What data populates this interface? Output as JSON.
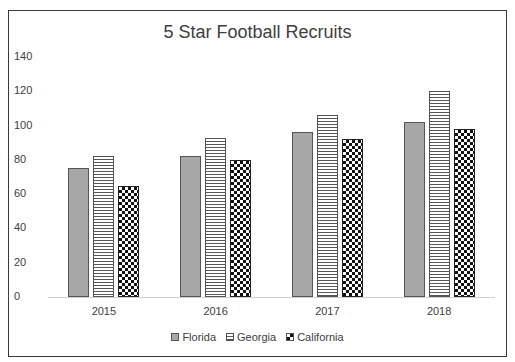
{
  "chart_data": {
    "type": "bar",
    "title": "5 Star Football Recruits",
    "xlabel": "",
    "ylabel": "",
    "categories": [
      "2015",
      "2016",
      "2017",
      "2018"
    ],
    "series": [
      {
        "name": "Florida",
        "pattern": "dotted",
        "values": [
          75,
          82,
          96,
          102
        ]
      },
      {
        "name": "Georgia",
        "pattern": "horizontal-stripes",
        "values": [
          82,
          93,
          106,
          120
        ]
      },
      {
        "name": "California",
        "pattern": "checkerboard",
        "values": [
          65,
          80,
          92,
          98
        ]
      }
    ],
    "ylim": [
      0,
      140
    ],
    "yticks": [
      "0",
      "20",
      "40",
      "60",
      "80",
      "100",
      "120",
      "140"
    ],
    "grid": false,
    "legend_position": "bottom"
  },
  "legend": {
    "items": [
      {
        "label": "Florida"
      },
      {
        "label": "Georgia"
      },
      {
        "label": "California"
      }
    ]
  }
}
